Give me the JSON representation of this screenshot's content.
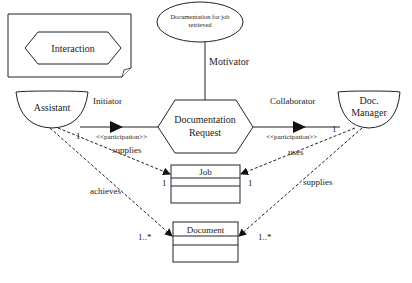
{
  "legend": {
    "label": "Interaction"
  },
  "motivator_goal": {
    "line1": "Documentation for job",
    "line2": "retrieved"
  },
  "motivator_label": "Motivator",
  "interaction": {
    "line1": "Documentation",
    "line2": "Request"
  },
  "actors": {
    "assistant": {
      "label": "Assistant"
    },
    "doc_manager": {
      "line1": "Doc.",
      "line2": "Manager"
    }
  },
  "roles": {
    "initiator": {
      "label": "Initiator",
      "stereotype": "<<participation>>"
    },
    "collaborator": {
      "label": "Collaborator",
      "stereotype": "<<participation>>"
    }
  },
  "classes": {
    "job": {
      "name": "Job"
    },
    "document": {
      "name": "Document"
    }
  },
  "relations": {
    "assistant_supplies_job": {
      "label": "supplies",
      "mult_source": "1",
      "mult_target": "1"
    },
    "assistant_achieves_document": {
      "label": "achieves",
      "mult_target": "1..*"
    },
    "manager_uses_job": {
      "label": "uses",
      "mult_source": "1",
      "mult_target": "1"
    },
    "manager_supplies_document": {
      "label": "supplies",
      "mult_target": "1..*"
    }
  },
  "colors": {
    "stroke": "#222222",
    "background": "#ffffff",
    "text": "#222222"
  }
}
